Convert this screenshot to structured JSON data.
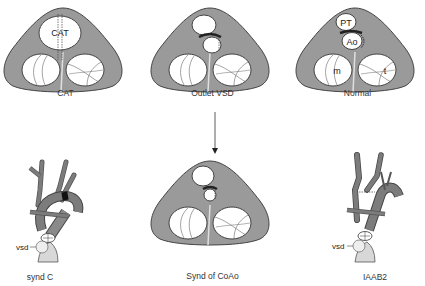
{
  "colors": {
    "heart_fill": "#9a9a9a",
    "heart_stroke": "#444444",
    "valve_fill": "#ffffff",
    "vessel_fill": "#7c7c7c",
    "ventricle_fill": "#d8d8d8",
    "text": "#333333"
  },
  "panels": {
    "cat": {
      "caption": "CAT",
      "inner_label": "CAT"
    },
    "outlet_vsd": {
      "caption": "Outlet VSD"
    },
    "normal": {
      "caption": "Normal",
      "labels": {
        "pt": "PT",
        "ao": "Ao",
        "mitral": "m",
        "tricuspid": "t"
      }
    },
    "synd_coao": {
      "caption": "Synd of CoAo"
    },
    "synd_c": {
      "caption": "synd C",
      "vsd_label": "vsd"
    },
    "iaab2": {
      "caption": "IAAB2",
      "vsd_label": "vsd"
    }
  },
  "arrow": {
    "direction": "down",
    "from": "outlet_vsd",
    "to": "synd_coao"
  }
}
